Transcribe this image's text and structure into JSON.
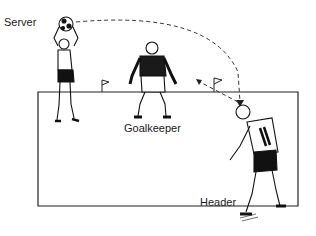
{
  "labels": {
    "server": "Server",
    "goalkeeper": "Goalkeeper",
    "header": "Header"
  },
  "figure_description": "Soccer heading drill: server throws ball, header heads it toward goal defended by goalkeeper",
  "jersey_number": "11"
}
